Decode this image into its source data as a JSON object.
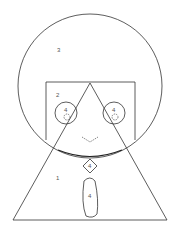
{
  "diagram": {
    "background": "#ffffff",
    "stroke_color": "#333333",
    "shapes": {
      "big_circle": {
        "label": "3",
        "cx": 90,
        "cy": 86,
        "r": 72
      },
      "rectangle": {
        "label": "2",
        "x": 45,
        "y": 82,
        "w": 90,
        "h": 58
      },
      "triangle": {
        "label": "1",
        "apex": [
          90,
          83
        ],
        "base_left": [
          13,
          220
        ],
        "base_right": [
          167,
          220
        ]
      },
      "left_circle": {
        "label": "4",
        "cx": 66,
        "cy": 113,
        "r": 11
      },
      "right_circle": {
        "label": "4",
        "cx": 114,
        "cy": 113,
        "r": 11
      },
      "diamond": {
        "label": "4",
        "cx": 90,
        "cy": 166,
        "half": 7
      },
      "oval": {
        "label": "4",
        "cx": 90,
        "cy": 197,
        "rx": 9,
        "ry": 21
      }
    },
    "labels": {
      "big_circle": "3",
      "rectangle": "2",
      "triangle": "1",
      "left_circle": "4",
      "right_circle": "4",
      "diamond": "4",
      "oval": "4"
    }
  }
}
